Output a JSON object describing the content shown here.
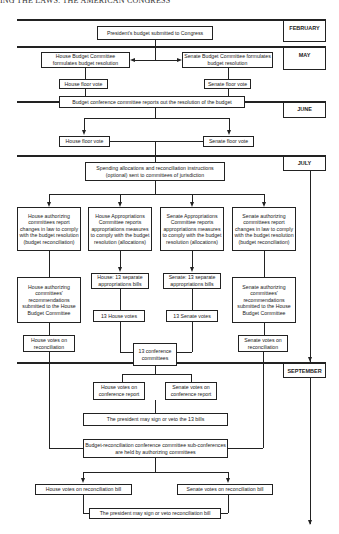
{
  "header": {
    "running_title": "ING THE LAWS: THE AMERICAN CONGRESS"
  },
  "months": {
    "february": "FEBRUARY",
    "may": "MAY",
    "june": "JUNE",
    "july": "JULY",
    "september": "SEPTEMBER"
  },
  "nodes": {
    "president_budget": "President's budget submitted to Congress",
    "house_budget_committee": "House Budget Committee formulates budget resolution",
    "senate_budget_committee": "Senate Budget Committee formulates budget resolution",
    "house_floor_vote_1": "House floor vote",
    "senate_floor_vote_1": "Senate floor vote",
    "budget_conference": "Budget conference committee reports out the resolution of the budget",
    "house_floor_vote_2": "House floor vote",
    "senate_floor_vote_2": "Senate floor vote",
    "spending_allocations": "Spending allocations and reconciliation instructions (optional) sent to committees of jurisdiction",
    "house_authorizing_report": "House authorizing committees report changes in law to comply with the budget resolution (budget reconciliation)",
    "house_appropriations_report": "House Appropriations Committee reports appropriations measures to comply with the budget resolution (allocations)",
    "senate_appropriations_report": "Senate Appropriations Committee reports appropriations measures to comply with the budget resolution (allocations)",
    "senate_authorizing_report": "Senate authorizing committees report changes in law to comply with the budget resolution (budget reconciliation)",
    "house_authorizing_recommendations": "House authorizing committees' recommendations submitted to the House Budget Committee",
    "house_13_bills": "House: 13 separate appropriations bills",
    "senate_13_bills": "Senate: 13 separate appropriations bills",
    "senate_authorizing_recommendations": "Senate authorizing committees' recommendations submitted to the House Budget Committee",
    "house_13_votes": "13 House votes",
    "senate_13_votes": "13 Senate votes",
    "house_votes_reconciliation": "House votes on reconciliation",
    "senate_votes_reconciliation": "Senate votes on reconciliation",
    "conference_committees_13": "13 conference committees",
    "house_votes_conference_report": "House votes on conference report",
    "senate_votes_conference_report": "Senate votes on conference report",
    "president_13_bills": "The president may sign or veto the 13 bills",
    "reconciliation_conference": "Budget-reconciliation conference committee sub-conferences are held by authorizing committees",
    "house_votes_reconciliation_bill": "House votes on reconciliation bill",
    "senate_votes_reconciliation_bill": "Senate votes on reconciliation bill",
    "president_reconciliation_bill": "The president may sign or veto reconciliation bill"
  }
}
